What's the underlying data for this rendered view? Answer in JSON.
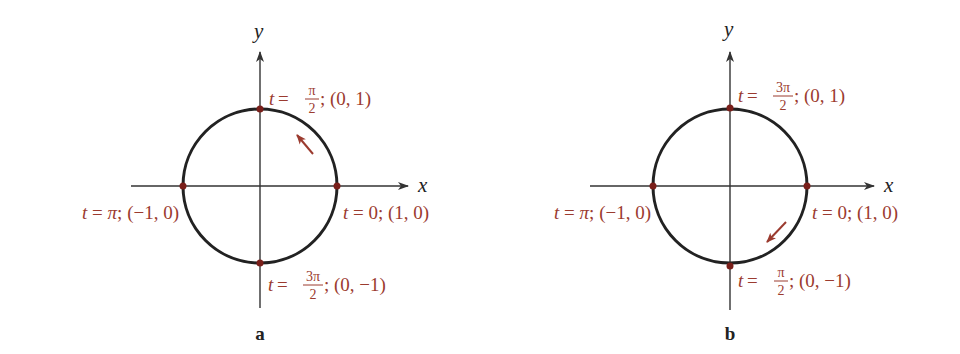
{
  "colors": {
    "curve": "#222222",
    "axis": "#333333",
    "label": "#9b3b2f",
    "point": "#7a1f1a"
  },
  "diagrams": [
    {
      "caption": "a",
      "x_axis_label": "x",
      "y_axis_label": "y",
      "direction": "counterclockwise",
      "points": {
        "top": {
          "t_num": "π",
          "t_den": "2",
          "coord": "(0, 1)"
        },
        "right": {
          "t": "0",
          "coord": "(1, 0)"
        },
        "left": {
          "t": "π",
          "coord": "(−1, 0)"
        },
        "bottom": {
          "t_num": "3π",
          "t_den": "2",
          "coord": "(0, −1)"
        }
      }
    },
    {
      "caption": "b",
      "x_axis_label": "x",
      "y_axis_label": "y",
      "direction": "clockwise",
      "points": {
        "top": {
          "t_num": "3π",
          "t_den": "2",
          "coord": "(0, 1)"
        },
        "right": {
          "t": "0",
          "coord": "(1, 0)"
        },
        "left": {
          "t": "π",
          "coord": "(−1, 0)"
        },
        "bottom": {
          "t_num": "π",
          "t_den": "2",
          "coord": "(0, −1)"
        }
      }
    }
  ],
  "text": {
    "t": "t",
    "eq": " = ",
    "semi": ";"
  }
}
